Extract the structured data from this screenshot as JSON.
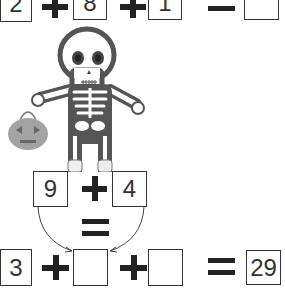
{
  "top_row": {
    "terms": [
      "2",
      "8",
      "1"
    ],
    "operators": [
      "+",
      "+"
    ],
    "equals": "=",
    "answer": ""
  },
  "middle": {
    "left_value": "9",
    "operator": "+",
    "right_value": "4",
    "equals": "="
  },
  "bottom_row": {
    "first": "3",
    "operators": [
      "+",
      "+"
    ],
    "blank_1": "",
    "blank_2": "",
    "equals": "=",
    "result": "29"
  },
  "illustration": {
    "character": "skeleton-icon",
    "held_item": "pumpkin-bucket-icon",
    "colors": {
      "outline": "#555555",
      "eyes": "#444444",
      "pumpkin": "#a3a3a3"
    }
  }
}
